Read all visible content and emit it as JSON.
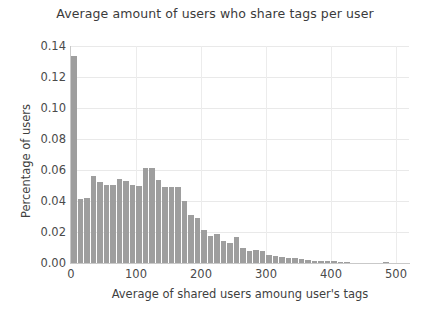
{
  "chart_data": {
    "type": "bar",
    "title": "Average amount of users who share tags per user",
    "xlabel": "Average of shared users amoung user's tags",
    "ylabel": "Percentage of users",
    "xlim": [
      0,
      520
    ],
    "ylim": [
      0.0,
      0.14
    ],
    "grid": true,
    "legend": null,
    "bar_color": "#9e9e9e",
    "xticks": [
      0,
      100,
      200,
      300,
      400,
      500
    ],
    "xticklabels": [
      "0",
      "100",
      "200",
      "300",
      "400",
      "500"
    ],
    "yticks": [
      0.0,
      0.02,
      0.04,
      0.06,
      0.08,
      0.1,
      0.12,
      0.14
    ],
    "yticklabels": [
      "0.00",
      "0.02",
      "0.04",
      "0.06",
      "0.08",
      "0.10",
      "0.12",
      "0.14"
    ],
    "bin_width": 10,
    "x": [
      5,
      15,
      25,
      35,
      45,
      55,
      65,
      75,
      85,
      95,
      105,
      115,
      125,
      135,
      145,
      155,
      165,
      175,
      185,
      195,
      205,
      215,
      225,
      235,
      245,
      255,
      265,
      275,
      285,
      295,
      305,
      315,
      325,
      335,
      345,
      355,
      365,
      375,
      385,
      395,
      405,
      415,
      425,
      435,
      445,
      455,
      465,
      475,
      485,
      495
    ],
    "values": [
      0.1335,
      0.0415,
      0.042,
      0.056,
      0.052,
      0.0505,
      0.0505,
      0.054,
      0.053,
      0.0505,
      0.05,
      0.061,
      0.0615,
      0.0535,
      0.049,
      0.049,
      0.049,
      0.04,
      0.031,
      0.029,
      0.0215,
      0.0175,
      0.0185,
      0.014,
      0.013,
      0.0165,
      0.0095,
      0.0075,
      0.0085,
      0.0075,
      0.005,
      0.0045,
      0.004,
      0.0035,
      0.003,
      0.0025,
      0.002,
      0.0012,
      0.001,
      0.0015,
      0.0012,
      0.0008,
      0.0006,
      0.0,
      0.0,
      0.0,
      0.0,
      0.0,
      0.0007,
      0.0
    ]
  }
}
